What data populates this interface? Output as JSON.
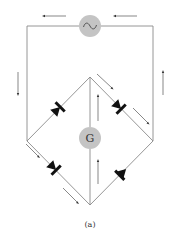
{
  "figure": {
    "caption": "(a)",
    "source": {
      "label": "~",
      "name": "AC source"
    },
    "meter": {
      "label": "G",
      "name": "Galvanometer"
    },
    "colors": {
      "wire": "#8a8a8a",
      "component_fill": "#c4c4c4",
      "diode": "#111111",
      "arrow": "#555555"
    },
    "diodes": [
      {
        "position": "upper-left"
      },
      {
        "position": "upper-right"
      },
      {
        "position": "lower-left"
      },
      {
        "position": "lower-right"
      }
    ],
    "current_arrows": [
      {
        "position": "top-left",
        "direction": "left"
      },
      {
        "position": "top-right",
        "direction": "left"
      },
      {
        "position": "left-side",
        "direction": "down"
      },
      {
        "position": "right-side",
        "direction": "up"
      },
      {
        "position": "upper-right-branch",
        "direction": "down-right"
      },
      {
        "position": "center",
        "direction": "up"
      },
      {
        "position": "lower-left-branch",
        "direction": "down-right"
      },
      {
        "position": "lower-center",
        "direction": "up"
      }
    ]
  }
}
